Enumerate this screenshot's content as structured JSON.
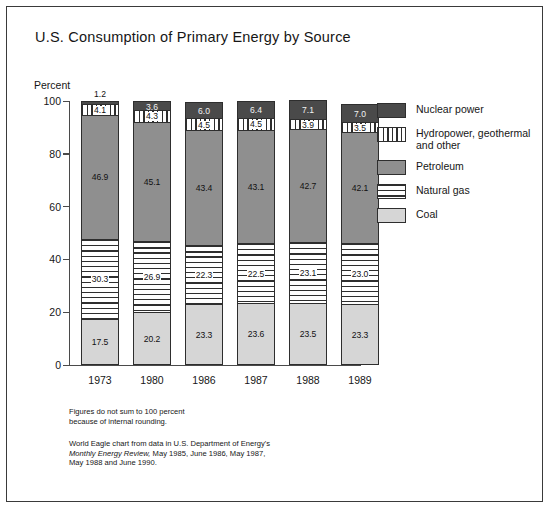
{
  "title": "U.S. Consumption of Primary Energy by Source",
  "axis": {
    "ylabel": "Percent",
    "yticks": [
      "100",
      "80",
      "60",
      "40",
      "20",
      "0"
    ]
  },
  "legend": [
    {
      "key": "nuclear",
      "label": "Nuclear power"
    },
    {
      "key": "hydro",
      "label": "Hydropower, geothermal and other"
    },
    {
      "key": "petroleum",
      "label": "Petroleum"
    },
    {
      "key": "gas",
      "label": "Natural gas"
    },
    {
      "key": "coal",
      "label": "Coal"
    }
  ],
  "notes": {
    "rounding_line1": "Figures do not sum to 100 percent",
    "rounding_line2": "because of internal rounding.",
    "source_line1": "World Eagle chart from data in U.S. Department  of Energy's",
    "source_line2_italic": "Monthly Energy Review,",
    "source_line2_rest": " May 1985, June 1986, May 1987,",
    "source_line3": "May 1988 and June 1990."
  },
  "chart_data": {
    "type": "bar",
    "title": "U.S. Consumption of Primary Energy by Source",
    "xlabel": "",
    "ylabel": "Percent",
    "ylim": [
      0,
      100
    ],
    "grid": false,
    "stacked": true,
    "legend_position": "right",
    "categories": [
      "1973",
      "1980",
      "1986",
      "1987",
      "1988",
      "1989"
    ],
    "series": [
      {
        "name": "Coal",
        "values": [
          17.5,
          20.2,
          23.3,
          23.6,
          23.5,
          23.3
        ]
      },
      {
        "name": "Natural gas",
        "values": [
          30.3,
          26.9,
          22.3,
          22.5,
          23.1,
          23.0
        ]
      },
      {
        "name": "Petroleum",
        "values": [
          46.9,
          45.1,
          43.4,
          43.1,
          42.7,
          42.1
        ]
      },
      {
        "name": "Hydropower, geothermal and other",
        "values": [
          4.1,
          4.3,
          4.5,
          4.5,
          3.9,
          3.5
        ]
      },
      {
        "name": "Nuclear power",
        "values": [
          1.2,
          3.6,
          6.0,
          6.4,
          7.1,
          7.0
        ]
      }
    ]
  },
  "bars": [
    {
      "year": "1973",
      "nuclear": {
        "value": 1.2,
        "label": "1.2",
        "label_above": true
      },
      "hydro": {
        "value": 4.1,
        "label": "4.1"
      },
      "petroleum": {
        "value": 46.9,
        "label": "46.9"
      },
      "gas": {
        "value": 30.3,
        "label": "30.3"
      },
      "coal": {
        "value": 17.5,
        "label": "17.5"
      }
    },
    {
      "year": "1980",
      "nuclear": {
        "value": 3.6,
        "label": "3.6",
        "label_above": false
      },
      "hydro": {
        "value": 4.3,
        "label": "4.3"
      },
      "petroleum": {
        "value": 45.1,
        "label": "45.1"
      },
      "gas": {
        "value": 26.9,
        "label": "26.9"
      },
      "coal": {
        "value": 20.2,
        "label": "20.2"
      }
    },
    {
      "year": "1986",
      "nuclear": {
        "value": 6.0,
        "label": "6.0",
        "label_above": false
      },
      "hydro": {
        "value": 4.5,
        "label": "4.5"
      },
      "petroleum": {
        "value": 43.4,
        "label": "43.4"
      },
      "gas": {
        "value": 22.3,
        "label": "22.3"
      },
      "coal": {
        "value": 23.3,
        "label": "23.3"
      }
    },
    {
      "year": "1987",
      "nuclear": {
        "value": 6.4,
        "label": "6.4",
        "label_above": false
      },
      "hydro": {
        "value": 4.5,
        "label": "4.5"
      },
      "petroleum": {
        "value": 43.1,
        "label": "43.1"
      },
      "gas": {
        "value": 22.5,
        "label": "22.5"
      },
      "coal": {
        "value": 23.6,
        "label": "23.6"
      }
    },
    {
      "year": "1988",
      "nuclear": {
        "value": 7.1,
        "label": "7.1",
        "label_above": false
      },
      "hydro": {
        "value": 3.9,
        "label": "3.9"
      },
      "petroleum": {
        "value": 42.7,
        "label": "42.7"
      },
      "gas": {
        "value": 23.1,
        "label": "23.1"
      },
      "coal": {
        "value": 23.5,
        "label": "23.5"
      }
    },
    {
      "year": "1989",
      "nuclear": {
        "value": 7.0,
        "label": "7.0",
        "label_above": false
      },
      "hydro": {
        "value": 3.5,
        "label": "3.5"
      },
      "petroleum": {
        "value": 42.1,
        "label": "42.1"
      },
      "gas": {
        "value": 23.0,
        "label": "23.0"
      },
      "coal": {
        "value": 23.3,
        "label": "23.3"
      }
    }
  ],
  "colors": {
    "nuclear": "#4a4a4a",
    "petroleum": "#8f8f8f",
    "coal": "#d6d6d6",
    "stroke": "#2e2e2e",
    "axis": "#4a4a4a"
  }
}
